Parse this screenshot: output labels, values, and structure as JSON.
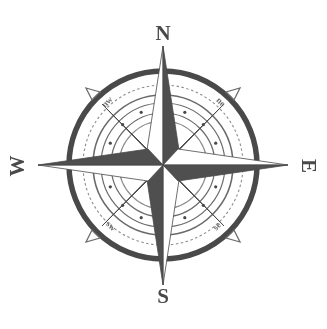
{
  "figure": {
    "name": "compass-rose",
    "background_color": "#ffffff",
    "ink_color": "#4a4a4a",
    "ink_color_light": "#8c8c8c",
    "ink_color_mid": "#6b6b6b",
    "center": {
      "x": 163,
      "y": 165
    },
    "width": 327,
    "height": 329
  },
  "labels": {
    "cardinal": [
      {
        "id": "north",
        "text": "N",
        "bearing_deg": 0,
        "x": 163,
        "y": 40,
        "rotation": 0
      },
      {
        "id": "east",
        "text": "E",
        "bearing_deg": 90,
        "x": 300,
        "y": 166,
        "rotation": 90
      },
      {
        "id": "south",
        "text": "S",
        "bearing_deg": 180,
        "x": 163,
        "y": 300,
        "rotation": 0
      },
      {
        "id": "west",
        "text": "W",
        "bearing_deg": 270,
        "x": 25,
        "y": 166,
        "rotation": -90
      }
    ],
    "ordinal": [
      {
        "id": "northwest",
        "text": "nw",
        "bearing_deg": 315,
        "x": 109,
        "y": 104,
        "rotation": -45
      },
      {
        "id": "northeast",
        "text": "ne",
        "bearing_deg": 45,
        "x": 219,
        "y": 104,
        "rotation": 45
      },
      {
        "id": "southeast",
        "text": "se",
        "bearing_deg": 135,
        "x": 219,
        "y": 228,
        "rotation": -45
      },
      {
        "id": "southwest",
        "text": "sw",
        "bearing_deg": 225,
        "x": 109,
        "y": 228,
        "rotation": 45
      }
    ]
  },
  "rings": [
    {
      "id": "outer-thick-ring",
      "radius": 94,
      "stroke_width": 5.5,
      "style": "solid",
      "color": "#4a4a4a"
    },
    {
      "id": "graduation-ring",
      "radius": 80,
      "stroke_width": 1.1,
      "style": "dashed",
      "color": "#8c8c8c"
    },
    {
      "id": "mid-ring",
      "radius": 70,
      "stroke_width": 1.6,
      "style": "solid",
      "color": "#6b6b6b"
    },
    {
      "id": "dot-ring-outer",
      "radius": 62,
      "stroke_width": 1.2,
      "style": "solid",
      "color": "#6b6b6b"
    },
    {
      "id": "dot-ring-inner",
      "radius": 52,
      "stroke_width": 1.2,
      "style": "solid",
      "color": "#6b6b6b"
    },
    {
      "id": "hub-ring",
      "radius": 44,
      "stroke_width": 1.2,
      "style": "solid",
      "color": "#8c8c8c"
    }
  ],
  "dot_markers": {
    "id": "bearing-dots",
    "count": 16,
    "radius_on_circle": 57,
    "dot_radius": 1.6,
    "color": "#4a4a4a"
  },
  "star": {
    "points_count": 8,
    "cardinal_spike_length": 128,
    "ordinal_spike_length": 86,
    "spike_half_width": 15,
    "dark_color": "#4f4f4f",
    "light_color": "#ffffff",
    "outline_color": "#4a4a4a"
  },
  "outer_tick_arrows": {
    "id": "diagonal-arrowheads",
    "count": 4,
    "bearings_deg": [
      45,
      135,
      225,
      315
    ],
    "radius": 102,
    "size": 8,
    "color": "#6b6b6b"
  }
}
